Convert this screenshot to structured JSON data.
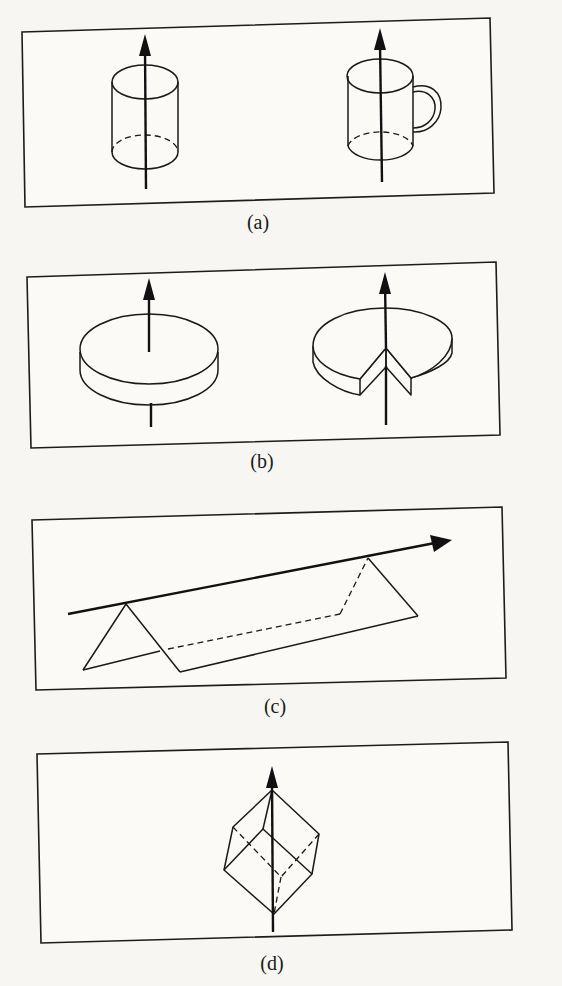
{
  "figure": {
    "panels": [
      {
        "id": "a",
        "label": "(a)",
        "objects": [
          "cylinder",
          "mug"
        ],
        "axis": "vertical"
      },
      {
        "id": "b",
        "label": "(b)",
        "objects": [
          "disk",
          "disk-with-wedge-cut"
        ],
        "axis": "vertical"
      },
      {
        "id": "c",
        "label": "(c)",
        "objects": [
          "triangular-prism"
        ],
        "axis": "along-ridge"
      },
      {
        "id": "d",
        "label": "(d)",
        "objects": [
          "cube"
        ],
        "axis": "body-diagonal"
      }
    ]
  },
  "colors": {
    "ink": "#1a1a1a",
    "paper": "#f7f6f2"
  }
}
